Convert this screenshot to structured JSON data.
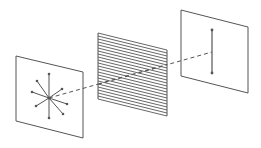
{
  "diagram": {
    "type": "polarization",
    "colors": {
      "stroke": "#555555",
      "background": "#ffffff"
    },
    "unpolarized_panel": {
      "corners": [
        [
          16,
          56
        ],
        [
          83,
          72
        ],
        [
          83,
          138
        ],
        [
          16,
          121
        ]
      ],
      "center": [
        49,
        98
      ],
      "ray_ends": [
        [
          49,
          74
        ],
        [
          49,
          118
        ],
        [
          37,
          81
        ],
        [
          32,
          92
        ],
        [
          36,
          106
        ],
        [
          63,
          114
        ],
        [
          67,
          104
        ],
        [
          62,
          89
        ]
      ]
    },
    "polarizer": {
      "corners": [
        [
          98,
          33
        ],
        [
          167,
          50
        ],
        [
          167,
          116
        ],
        [
          98,
          99
        ]
      ],
      "line_count": 22
    },
    "polarized_panel": {
      "corners": [
        [
          181,
          10
        ],
        [
          248,
          27
        ],
        [
          248,
          93
        ],
        [
          181,
          76
        ]
      ],
      "arrow": {
        "x": 212,
        "y1": 30,
        "y2": 73
      }
    },
    "beam": {
      "from": [
        49,
        98
      ],
      "to": [
        212,
        52
      ]
    }
  }
}
